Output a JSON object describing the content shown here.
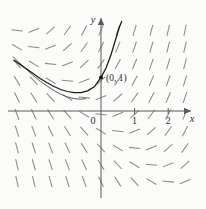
{
  "figure": {
    "type": "direction-field",
    "background_color": "#fbfbfa",
    "axis_color": "#5a5a5a",
    "slope_color": "#8b8b8b",
    "curve_color": "#1a1a1a"
  },
  "axes": {
    "x_label": "x",
    "y_label": "y",
    "x_ticks": [
      {
        "label": "0",
        "value": 0
      },
      {
        "label": "1",
        "value": 1
      },
      {
        "label": "2",
        "value": 2
      }
    ],
    "y_ticks": []
  },
  "annotations": {
    "initial_point_label": "(0, 1)"
  },
  "chart_data": {
    "type": "line",
    "title": "",
    "xlabel": "x",
    "ylabel": "y",
    "xlim": [
      -2.65,
      2.85
    ],
    "ylim": [
      -2.55,
      2.7
    ],
    "grid": false,
    "legend": "none",
    "slope_field": {
      "x_values": [
        -2.5,
        -2.0,
        -1.5,
        -1.0,
        -0.5,
        0.0,
        0.5,
        1.0,
        1.5,
        2.0,
        2.5
      ],
      "y_values": [
        2.4,
        1.9,
        1.4,
        0.9,
        0.4,
        -0.1,
        -0.6,
        -1.1,
        -1.6,
        -2.1
      ],
      "slope_rule": "dy/dx = x + y",
      "segment_length": 0.34
    },
    "series": [
      {
        "name": "solution-curve",
        "x": [
          -2.6,
          -2.4,
          -2.2,
          -2.0,
          -1.8,
          -1.6,
          -1.4,
          -1.2,
          -1.0,
          -0.8,
          -0.6,
          -0.4,
          -0.2,
          0.0,
          0.15,
          0.3,
          0.45,
          0.55,
          0.62
        ],
        "y": [
          1.52,
          1.38,
          1.24,
          1.1,
          0.96,
          0.84,
          0.73,
          0.64,
          0.58,
          0.55,
          0.55,
          0.6,
          0.72,
          1.0,
          1.28,
          1.68,
          2.18,
          2.5,
          2.68
        ]
      },
      {
        "name": "solution-curve-secondary",
        "x": [
          -2.62,
          -2.4,
          -2.2,
          -2.0,
          -1.8,
          -1.6,
          -1.4,
          -1.2,
          -1.0,
          -0.8,
          -0.6,
          -0.45
        ],
        "y": [
          1.62,
          1.4,
          1.22,
          1.04,
          0.88,
          0.74,
          0.61,
          0.5,
          0.42,
          0.37,
          0.35,
          0.37
        ]
      }
    ],
    "points": [
      {
        "label": "(0, 1)",
        "x": 0,
        "y": 1
      }
    ]
  }
}
